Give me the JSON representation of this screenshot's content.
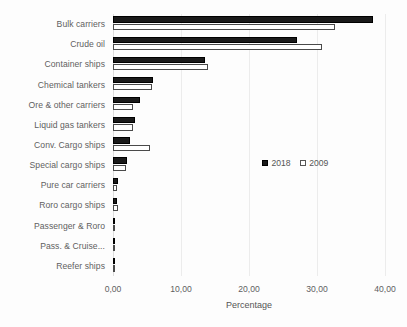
{
  "chart_data": {
    "type": "bar",
    "orientation": "horizontal",
    "title": "",
    "xlabel": "Percentage",
    "ylabel": "",
    "xlim": [
      0,
      40
    ],
    "xticks": [
      "0,00",
      "10,00",
      "20,00",
      "30,00",
      "40,00"
    ],
    "xtick_values": [
      0,
      10,
      20,
      30,
      40
    ],
    "grid": true,
    "legend_position": "middle-right",
    "categories": [
      "Bulk carriers",
      "Crude oil",
      "Container ships",
      "Chemical tankers",
      "Ore & other carriers",
      "Liquid gas tankers",
      "Conv. Cargo ships",
      "Special cargo ships",
      "Pure car carriers",
      "Roro cargo ships",
      "Passenger & Roro",
      "Pass. & Cruise...",
      "Reefer ships"
    ],
    "series": [
      {
        "name": "2018",
        "color": "#1a1a1a",
        "values": [
          38.2,
          27.1,
          13.6,
          5.9,
          4.0,
          3.2,
          2.5,
          2.0,
          0.8,
          0.6,
          0.3,
          0.25,
          0.2
        ]
      },
      {
        "name": "2009",
        "color": "#ffffff",
        "values": [
          32.6,
          30.7,
          13.9,
          5.8,
          2.9,
          2.9,
          5.4,
          1.9,
          0.6,
          0.8,
          0.35,
          0.3,
          0.35
        ]
      }
    ]
  },
  "legend": {
    "entries": [
      {
        "label": "2018",
        "swatch": "filled-square-icon"
      },
      {
        "label": "2009",
        "swatch": "hollow-square-icon"
      }
    ]
  }
}
